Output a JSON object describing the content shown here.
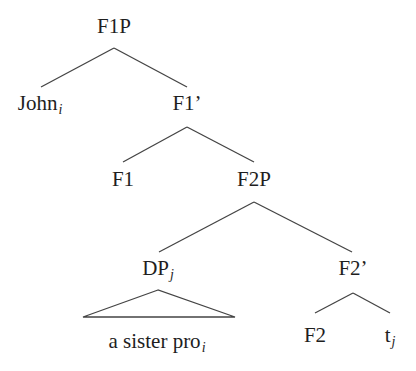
{
  "diagram": {
    "type": "syntax-tree",
    "nodes": {
      "f1p": {
        "label": "F1P",
        "sub": ""
      },
      "john": {
        "label": "John",
        "sub": "i"
      },
      "f1bar": {
        "label": "F1’",
        "sub": ""
      },
      "f1": {
        "label": "F1",
        "sub": ""
      },
      "f2p": {
        "label": "F2P",
        "sub": ""
      },
      "dp": {
        "label": "DP",
        "sub": "j"
      },
      "f2bar": {
        "label": "F2’",
        "sub": ""
      },
      "dp_content": {
        "label": "a sister pro",
        "sub": "i"
      },
      "f2": {
        "label": "F2",
        "sub": ""
      },
      "trace": {
        "label": "t",
        "sub": "j"
      }
    },
    "edges": [
      [
        "F1P",
        "John_i"
      ],
      [
        "F1P",
        "F1'"
      ],
      [
        "F1'",
        "F1"
      ],
      [
        "F1'",
        "F2P"
      ],
      [
        "F2P",
        "DP_j"
      ],
      [
        "F2P",
        "F2'"
      ],
      [
        "DP_j",
        "a sister pro_i (triangle)"
      ],
      [
        "F2'",
        "F2"
      ],
      [
        "F2'",
        "t_j"
      ]
    ],
    "line_color": "#444444",
    "text_color": "#1e1e1e"
  }
}
